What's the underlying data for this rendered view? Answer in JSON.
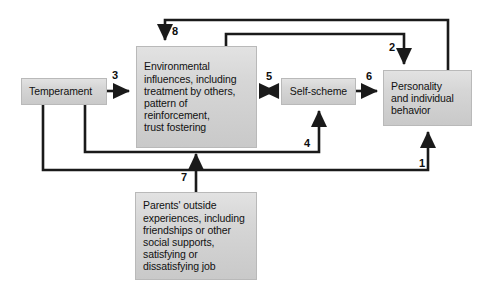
{
  "diagram": {
    "type": "flow-diagram",
    "background_color": "#ffffff",
    "box_fill_color": "#d6d6d6",
    "box_border_color": "#b9b9b9",
    "line_color": "#1a1a1a",
    "nodes": [
      {
        "id": "temperament",
        "label": "Temperament"
      },
      {
        "id": "environmental",
        "label": "Environmental\ninfluences, including\ntreatment by others,\npattern of\nreinforcement,\ntrust fostering"
      },
      {
        "id": "self_scheme",
        "label": "Self-scheme"
      },
      {
        "id": "personality",
        "label": "Personality\nand individual\nbehavior"
      },
      {
        "id": "parents",
        "label": "Parents' outside\nexperiences, including\nfriendships or other\nsocial supports,\nsatisfying or\ndissatisfying job"
      }
    ],
    "edges": [
      {
        "number": "1",
        "from": "temperament",
        "to": "personality",
        "arrow": "single"
      },
      {
        "number": "2",
        "from": "environmental",
        "to": "personality",
        "arrow": "single"
      },
      {
        "number": "3",
        "from": "temperament",
        "to": "environmental",
        "arrow": "single"
      },
      {
        "number": "4",
        "from": "temperament",
        "to": "self_scheme",
        "arrow": "single"
      },
      {
        "number": "5",
        "from": "environmental",
        "to": "self_scheme",
        "arrow": "double"
      },
      {
        "number": "6",
        "from": "self_scheme",
        "to": "personality",
        "arrow": "single"
      },
      {
        "number": "7",
        "from": "parents",
        "to": "environmental",
        "arrow": "single"
      },
      {
        "number": "8",
        "from": "personality",
        "to": "environmental",
        "arrow": "single"
      }
    ]
  }
}
